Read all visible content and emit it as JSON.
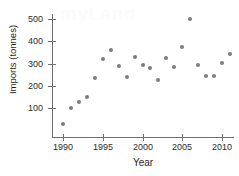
{
  "watermark": {
    "text": "myLand"
  },
  "chart_data": {
    "type": "scatter",
    "title": "",
    "xlabel": "Year",
    "ylabel": "Imports (tonnes)",
    "xlim": [
      1988.5,
      2012.5
    ],
    "ylim": [
      0,
      540
    ],
    "grid": false,
    "legend": null,
    "x_ticks": [
      1990,
      1995,
      2000,
      2005,
      2010
    ],
    "y_ticks": [
      100,
      200,
      300,
      400,
      500
    ],
    "marker": "circle",
    "marker_color": "#7b7b7b",
    "x": [
      1990,
      1991,
      1992,
      1993,
      1994,
      1995,
      1996,
      1997,
      1998,
      1999,
      2000,
      2001,
      2002,
      2003,
      2004,
      2005,
      2006,
      2007,
      2008,
      2009,
      2010,
      2011
    ],
    "values": [
      28,
      100,
      127,
      148,
      235,
      320,
      363,
      290,
      240,
      330,
      292,
      282,
      225,
      323,
      285,
      375,
      500,
      293,
      242,
      243,
      303,
      345
    ],
    "points": [
      {
        "year": 1990,
        "imports": 28
      },
      {
        "year": 1991,
        "imports": 100
      },
      {
        "year": 1992,
        "imports": 127
      },
      {
        "year": 1993,
        "imports": 148
      },
      {
        "year": 1994,
        "imports": 235
      },
      {
        "year": 1995,
        "imports": 320
      },
      {
        "year": 1996,
        "imports": 363
      },
      {
        "year": 1997,
        "imports": 290
      },
      {
        "year": 1998,
        "imports": 240
      },
      {
        "year": 1999,
        "imports": 330
      },
      {
        "year": 2000,
        "imports": 292
      },
      {
        "year": 2001,
        "imports": 282
      },
      {
        "year": 2002,
        "imports": 225
      },
      {
        "year": 2003,
        "imports": 323
      },
      {
        "year": 2004,
        "imports": 285
      },
      {
        "year": 2005,
        "imports": 375
      },
      {
        "year": 2006,
        "imports": 500
      },
      {
        "year": 2007,
        "imports": 293
      },
      {
        "year": 2008,
        "imports": 242
      },
      {
        "year": 2009,
        "imports": 243
      },
      {
        "year": 2010,
        "imports": 303
      },
      {
        "year": 2011,
        "imports": 345
      }
    ]
  }
}
